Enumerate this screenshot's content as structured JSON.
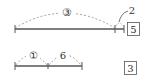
{
  "problems": [
    {
      "segment_label": "③",
      "sub_segment_label": "2",
      "answer": "5"
    },
    {
      "left_label": "①",
      "right_label": "6",
      "answer": "3"
    }
  ],
  "colors": {
    "line": "#555555",
    "dashed": "#888888",
    "text": "#333333"
  }
}
